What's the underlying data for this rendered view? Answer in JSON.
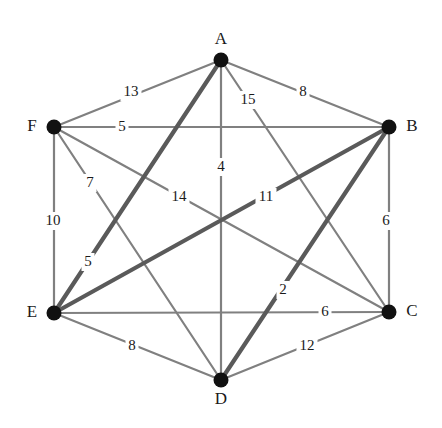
{
  "figure": {
    "title": "",
    "background_color": "#ffffff",
    "width": 442,
    "height": 428
  },
  "style": {
    "edge_color_normal": "#808080",
    "edge_color_highlight": "#5a5a5a",
    "node_color": "#111111",
    "label_color": "#1a1a1a",
    "edge_width_normal": 2.2,
    "edge_width_highlight": 4.2,
    "node_radius": 7.5
  },
  "chart_data": {
    "type": "diagram",
    "graph_type": "undirected-weighted-complete-graph",
    "title": "",
    "xlabel": "",
    "ylabel": "",
    "nodes": [
      {
        "id": "A",
        "label": "A",
        "x": 221,
        "y": 60,
        "label_x": 221,
        "label_y": 40
      },
      {
        "id": "B",
        "label": "B",
        "x": 389,
        "y": 127,
        "label_x": 412,
        "label_y": 127
      },
      {
        "id": "C",
        "label": "C",
        "x": 389,
        "y": 312,
        "label_x": 412,
        "label_y": 312
      },
      {
        "id": "D",
        "label": "D",
        "x": 221,
        "y": 380,
        "label_x": 221,
        "label_y": 400
      },
      {
        "id": "E",
        "label": "E",
        "x": 54,
        "y": 313,
        "label_x": 32,
        "label_y": 313
      },
      {
        "id": "F",
        "label": "F",
        "x": 54,
        "y": 127,
        "label_x": 32,
        "label_y": 127
      }
    ],
    "edges": [
      {
        "from": "A",
        "to": "F",
        "weight": 13,
        "label": "13",
        "label_x": 131,
        "label_y": 92,
        "highlight": false
      },
      {
        "from": "A",
        "to": "B",
        "weight": 8,
        "label": "8",
        "label_x": 303,
        "label_y": 92,
        "highlight": false
      },
      {
        "from": "A",
        "to": "C",
        "weight": 15,
        "label": "15",
        "label_x": 248,
        "label_y": 100,
        "highlight": false
      },
      {
        "from": "A",
        "to": "D",
        "weight": 4,
        "label": "4",
        "label_x": 221,
        "label_y": 167,
        "highlight": false
      },
      {
        "from": "A",
        "to": "E",
        "weight": 14,
        "label": "14",
        "label_x": 179,
        "label_y": 197,
        "highlight": true
      },
      {
        "from": "F",
        "to": "B",
        "weight": 5,
        "label": "5",
        "label_x": 122,
        "label_y": 127,
        "highlight": false
      },
      {
        "from": "F",
        "to": "C",
        "weight": 7,
        "label": "7",
        "label_x": 90,
        "label_y": 183,
        "highlight": false
      },
      {
        "from": "F",
        "to": "E",
        "weight": 10,
        "label": "10",
        "label_x": 53,
        "label_y": 221,
        "highlight": false
      },
      {
        "from": "F",
        "to": "D",
        "weight": 11,
        "label": "11",
        "label_x": 266,
        "label_y": 197,
        "highlight": false
      },
      {
        "from": "E",
        "to": "B",
        "weight": 5,
        "label": "5",
        "label_x": 88,
        "label_y": 262,
        "highlight": true
      },
      {
        "from": "E",
        "to": "C",
        "weight": 6,
        "label": "6",
        "label_x": 325,
        "label_y": 312,
        "highlight": false
      },
      {
        "from": "E",
        "to": "D",
        "weight": 8,
        "label": "8",
        "label_x": 132,
        "label_y": 346,
        "highlight": false
      },
      {
        "from": "B",
        "to": "C",
        "weight": 6,
        "label": "6",
        "label_x": 386,
        "label_y": 221,
        "highlight": false
      },
      {
        "from": "B",
        "to": "D",
        "weight": 2,
        "label": "2",
        "label_x": 283,
        "label_y": 290,
        "highlight": true
      },
      {
        "from": "C",
        "to": "D",
        "weight": 12,
        "label": "12",
        "label_x": 307,
        "label_y": 346,
        "highlight": false
      }
    ]
  }
}
